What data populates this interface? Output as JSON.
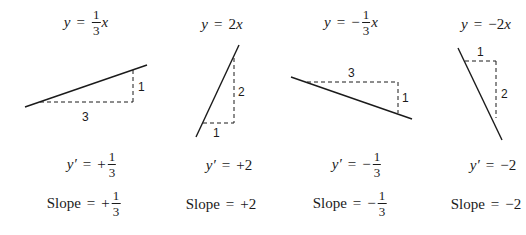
{
  "panels": [
    {
      "equation": {
        "lhs": "y",
        "sign": "",
        "frac_num": "1",
        "frac_den": "3",
        "coef": "",
        "var": "x"
      },
      "derivative": {
        "lhs": "y′",
        "sign": "+",
        "frac_num": "1",
        "frac_den": "3",
        "value": ""
      },
      "slope": {
        "label": "Slope",
        "sign": "+",
        "frac_num": "1",
        "frac_den": "3",
        "value": ""
      },
      "rise_label": "1",
      "run_label": "3",
      "line": {
        "x1": 25,
        "y1": 107,
        "x2": 147,
        "y2": 65
      },
      "run_dash": {
        "x1": 40,
        "y1": 102,
        "x2": 133,
        "y2": 102
      },
      "rise_dash": {
        "x1": 133,
        "y1": 70,
        "x2": 133,
        "y2": 102
      },
      "rise_pos": {
        "x": 138,
        "y": 91
      },
      "run_pos": {
        "x": 82,
        "y": 121
      }
    },
    {
      "equation": {
        "lhs": "y",
        "sign": "",
        "frac_num": "",
        "frac_den": "",
        "coef": "2",
        "var": "x"
      },
      "derivative": {
        "lhs": "y′",
        "sign": "",
        "frac_num": "",
        "frac_den": "",
        "value": "+2"
      },
      "slope": {
        "label": "Slope",
        "sign": "",
        "frac_num": "",
        "frac_den": "",
        "value": "+2"
      },
      "rise_label": "2",
      "run_label": "1",
      "line": {
        "x1": 196,
        "y1": 137,
        "x2": 239,
        "y2": 45
      },
      "run_dash": {
        "x1": 203,
        "y1": 123,
        "x2": 234,
        "y2": 123
      },
      "rise_dash": {
        "x1": 234,
        "y1": 58,
        "x2": 234,
        "y2": 123
      },
      "rise_pos": {
        "x": 238,
        "y": 96
      },
      "run_pos": {
        "x": 213,
        "y": 137
      }
    },
    {
      "equation": {
        "lhs": "y",
        "sign": "−",
        "frac_num": "1",
        "frac_den": "3",
        "coef": "",
        "var": "x"
      },
      "derivative": {
        "lhs": "y′",
        "sign": "−",
        "frac_num": "1",
        "frac_den": "3",
        "value": ""
      },
      "slope": {
        "label": "Slope",
        "sign": "−",
        "frac_num": "1",
        "frac_den": "3",
        "value": ""
      },
      "rise_label": "1",
      "run_label": "3",
      "line": {
        "x1": 291,
        "y1": 77,
        "x2": 412,
        "y2": 119
      },
      "run_dash": {
        "x1": 307,
        "y1": 82,
        "x2": 398,
        "y2": 82
      },
      "rise_dash": {
        "x1": 398,
        "y1": 82,
        "x2": 398,
        "y2": 113
      },
      "rise_pos": {
        "x": 402,
        "y": 102
      },
      "run_pos": {
        "x": 348,
        "y": 77
      }
    },
    {
      "equation": {
        "lhs": "y",
        "sign": "",
        "frac_num": "",
        "frac_den": "",
        "coef": "−2",
        "var": "x"
      },
      "derivative": {
        "lhs": "y′",
        "sign": "",
        "frac_num": "",
        "frac_den": "",
        "value": "−2"
      },
      "slope": {
        "label": "Slope",
        "sign": "",
        "frac_num": "",
        "frac_den": "",
        "value": "−2"
      },
      "rise_label": "2",
      "run_label": "1",
      "line": {
        "x1": 458,
        "y1": 48,
        "x2": 502,
        "y2": 140
      },
      "run_dash": {
        "x1": 465,
        "y1": 61,
        "x2": 496,
        "y2": 61
      },
      "rise_dash": {
        "x1": 496,
        "y1": 61,
        "x2": 496,
        "y2": 118
      },
      "rise_pos": {
        "x": 501,
        "y": 98
      },
      "run_pos": {
        "x": 477,
        "y": 56
      }
    }
  ],
  "equals": "="
}
